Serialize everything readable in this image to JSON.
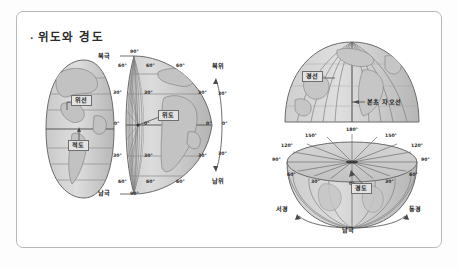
{
  "page": {
    "title": "위도와 경도",
    "bullet": "·",
    "background_color": "#ffffff",
    "frame_border_color": "#b9b9b9",
    "globe_fill_color": "#d2d2d2",
    "globe_outline_color": "#6b6b6b",
    "grid_line_color": "#8a8a8a",
    "label_chip_fill": "#e3e3e3",
    "label_chip_border": "#6e6e6e"
  },
  "figures": {
    "left_globe": {
      "name": "위선과 적도 반구",
      "labels": {
        "parallel": "위선",
        "equator": "적도"
      }
    },
    "middle_globe": {
      "name": "위도 구체",
      "labels": {
        "north_pole": "북극",
        "south_pole": "남극",
        "latitude": "위도",
        "north_latitude": "북위",
        "south_latitude": "남위"
      },
      "left_axis_degrees": [
        "90°",
        "60°",
        "30°",
        "0°",
        "30°",
        "60°",
        "90°"
      ],
      "inner_axis_degrees": [
        "90°",
        "60°",
        "30°",
        "0°",
        "30°",
        "60°",
        "90°"
      ],
      "right_rim_degrees": [
        "60°",
        "30°",
        "0°",
        "30°",
        "60°"
      ],
      "arc_degrees": [
        "30°",
        "0°",
        "30°"
      ]
    },
    "top_right_globe": {
      "name": "경선 반구",
      "labels": {
        "meridian": "경선",
        "prime_meridian": "본초 자오선"
      }
    },
    "bottom_right_globe": {
      "name": "경도 반구",
      "labels": {
        "longitude": "경도",
        "west_longitude": "서경",
        "east_longitude": "동경",
        "south_pole": "남극"
      },
      "top_rim_degrees": [
        "90°",
        "120°",
        "150°",
        "180°",
        "150°",
        "120°",
        "90°"
      ],
      "equator_degrees": [
        "60°",
        "30°",
        "0°",
        "30°",
        "60°"
      ]
    }
  }
}
